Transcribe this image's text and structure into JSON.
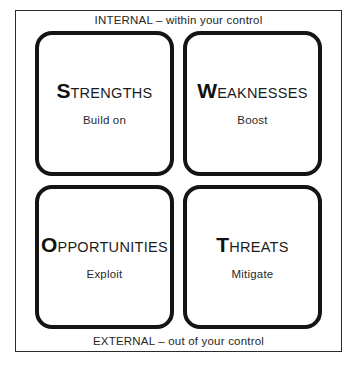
{
  "diagram": {
    "axis_labels": {
      "top": "INTERNAL – within your control",
      "bottom": "EXTERNAL – out of your control"
    },
    "colors": {
      "background": "#ffffff",
      "frame_border": "#2b2b2b",
      "box_border": "#141414",
      "text": "#1a1a1a"
    },
    "quadrants": [
      {
        "key": "strengths",
        "initial": "S",
        "rest": "TRENGTHS",
        "full_title": "STRENGTHS",
        "subtitle": "Build on",
        "position": "top-left"
      },
      {
        "key": "weaknesses",
        "initial": "W",
        "rest": "EAKNESSES",
        "full_title": "WEAKNESSES",
        "subtitle": "Boost",
        "position": "top-right"
      },
      {
        "key": "opportunities",
        "initial": "O",
        "rest": "PPORTUNITIES",
        "full_title": "OPPORTUNITIES",
        "subtitle": "Exploit",
        "position": "bottom-left"
      },
      {
        "key": "threats",
        "initial": "T",
        "rest": "HREATS",
        "full_title": "THREATS",
        "subtitle": "Mitigate",
        "position": "bottom-right"
      }
    ]
  }
}
